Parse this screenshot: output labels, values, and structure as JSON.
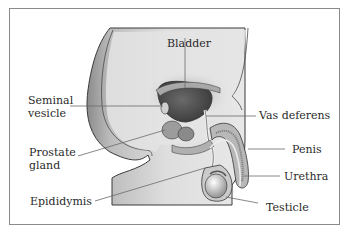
{
  "diagram": {
    "type": "anatomical illustration",
    "labels": {
      "bladder": "Bladder",
      "seminal_vesicle_line1": "Seminal",
      "seminal_vesicle_line2": "vesicle",
      "vas_deferens": "Vas deferens",
      "prostate_line1": "Prostate",
      "prostate_line2": "gland",
      "penis": "Penis",
      "urethra": "Urethra",
      "epididymis": "Epididymis",
      "testicle": "Testicle"
    },
    "colors": {
      "border": "#8a8a8a",
      "body_fill": "#dcdcdc",
      "body_shadow": "#9a9a9a",
      "organ_dark": "#5a5a5a",
      "leader_line": "#6a6a6a",
      "text": "#2a2a2a"
    }
  }
}
